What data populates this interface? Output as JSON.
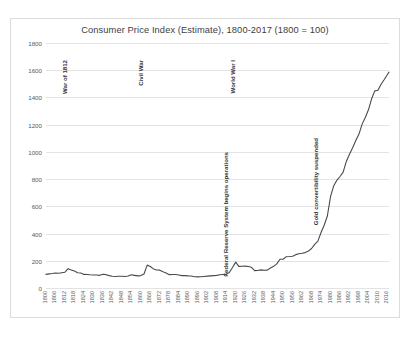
{
  "chart_data": {
    "type": "line",
    "title": "Consumer Price Index (Estimate), 1800-2017 (1800 = 100)",
    "xlabel": "",
    "ylabel": "",
    "ylim": [
      0,
      1800
    ],
    "ytick_step": 200,
    "yticks": [
      0,
      200,
      400,
      600,
      800,
      1000,
      1200,
      1400,
      1600,
      1800
    ],
    "xlim": [
      1800,
      2017
    ],
    "xtick_step": 6,
    "xticks": [
      1800,
      1806,
      1812,
      1818,
      1824,
      1830,
      1836,
      1842,
      1848,
      1854,
      1860,
      1866,
      1872,
      1878,
      1884,
      1890,
      1896,
      1902,
      1908,
      1914,
      1920,
      1926,
      1932,
      1938,
      1944,
      1950,
      1956,
      1962,
      1968,
      1974,
      1980,
      1986,
      1992,
      1998,
      2004,
      2010,
      2016
    ],
    "grid": true,
    "legend": "none",
    "line_color": "#4a4a4a",
    "grid_color": "#e3e3e3",
    "series": [
      {
        "name": "Consumer Price Index (Estimate)",
        "x": [
          1800,
          1802,
          1804,
          1806,
          1808,
          1810,
          1812,
          1814,
          1816,
          1818,
          1820,
          1822,
          1824,
          1826,
          1828,
          1830,
          1832,
          1834,
          1836,
          1838,
          1840,
          1842,
          1844,
          1846,
          1848,
          1850,
          1852,
          1854,
          1856,
          1858,
          1860,
          1862,
          1864,
          1866,
          1868,
          1870,
          1872,
          1874,
          1876,
          1878,
          1880,
          1882,
          1884,
          1886,
          1888,
          1890,
          1892,
          1894,
          1896,
          1898,
          1900,
          1902,
          1904,
          1906,
          1908,
          1910,
          1912,
          1914,
          1916,
          1918,
          1920,
          1922,
          1924,
          1926,
          1928,
          1930,
          1932,
          1934,
          1936,
          1938,
          1940,
          1942,
          1944,
          1946,
          1948,
          1950,
          1952,
          1954,
          1956,
          1958,
          1960,
          1962,
          1964,
          1966,
          1968,
          1970,
          1972,
          1974,
          1976,
          1978,
          1980,
          1982,
          1984,
          1986,
          1988,
          1990,
          1992,
          1994,
          1996,
          1998,
          2000,
          2002,
          2004,
          2006,
          2008,
          2010,
          2012,
          2014,
          2016,
          2017
        ],
        "values": [
          100,
          104,
          106,
          110,
          108,
          112,
          116,
          142,
          132,
          125,
          112,
          110,
          100,
          99,
          97,
          96,
          95,
          93,
          101,
          98,
          91,
          86,
          85,
          86,
          86,
          85,
          88,
          97,
          93,
          89,
          91,
          103,
          168,
          158,
          140,
          132,
          131,
          120,
          110,
          98,
          99,
          99,
          95,
          91,
          91,
          89,
          88,
          83,
          82,
          83,
          85,
          87,
          89,
          91,
          93,
          97,
          99,
          100,
          114,
          151,
          190,
          159,
          160,
          161,
          158,
          152,
          128,
          129,
          133,
          130,
          131,
          147,
          159,
          177,
          211,
          211,
          230,
          231,
          233,
          245,
          252,
          255,
          260,
          271,
          290,
          320,
          344,
          408,
          461,
          529,
          671,
          750,
          791,
          819,
          851,
          930,
          983,
          1030,
          1083,
          1131,
          1204,
          1253,
          1309,
          1390,
          1448,
          1453,
          1497,
          1532,
          1569,
          1586
        ],
        "peak_value": 1440,
        "peak_year": 2017,
        "start_value": 100,
        "start_year": 1800
      }
    ],
    "annotations": [
      {
        "label": "War of 1812",
        "year": 1812,
        "y_top": 228
      },
      {
        "label": "Civil War",
        "year": 1860,
        "y_top": 228
      },
      {
        "label": "Federal Reserve System begins operations",
        "year": 1914,
        "y_top": 136
      },
      {
        "label": "World War I",
        "year": 1918,
        "y_top": 228
      },
      {
        "label": "Gold convertibility suspended",
        "year": 1971,
        "y_top": 150
      }
    ]
  }
}
